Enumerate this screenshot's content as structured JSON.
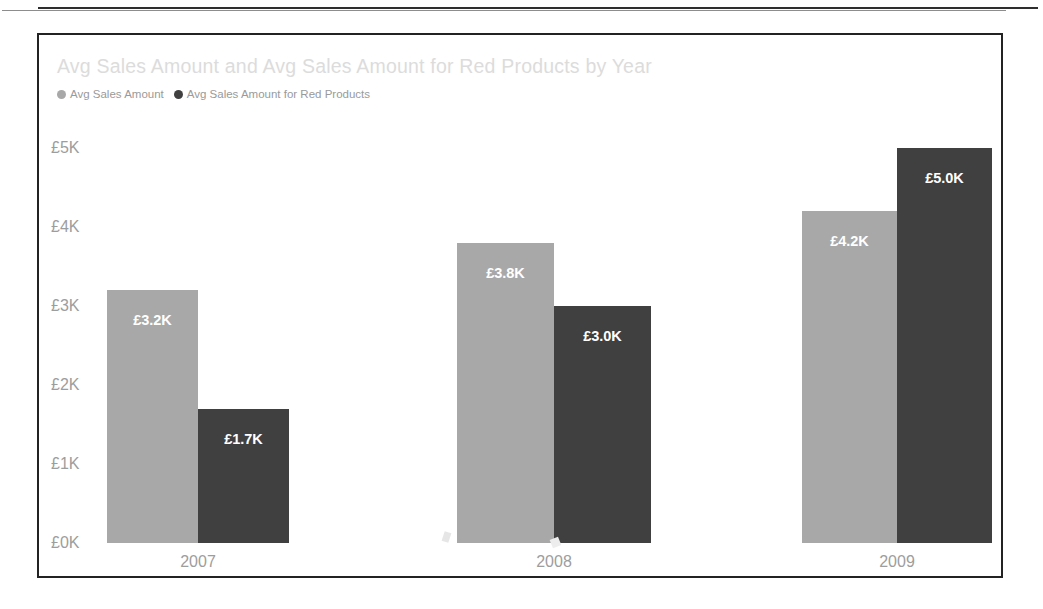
{
  "chart_data": {
    "type": "bar",
    "title": "Avg Sales Amount and Avg Sales Amount for Red Products by Year",
    "xlabel": "",
    "ylabel": "",
    "categories": [
      "2007",
      "2008",
      "2009"
    ],
    "series": [
      {
        "name": "Avg Sales Amount",
        "color": "#a8a8a8",
        "values": [
          3200,
          3800,
          4200
        ],
        "value_labels": [
          "£3.2K",
          "£3.8K",
          "£4.2K"
        ]
      },
      {
        "name": "Avg Sales Amount for Red Products",
        "color": "#404040",
        "values": [
          1700,
          3000,
          5000
        ],
        "value_labels": [
          "£1.7K",
          "£3.0K",
          "£5.0K"
        ]
      }
    ],
    "ylim": [
      0,
      5000
    ],
    "y_ticks": [
      0,
      1000,
      2000,
      3000,
      4000,
      5000
    ],
    "y_tick_labels": [
      "£0K",
      "£1K",
      "£2K",
      "£3K",
      "£4K",
      "£5K"
    ],
    "grid": false,
    "legend_position": "top-left",
    "currency": "GBP"
  },
  "legend": {
    "items": [
      {
        "label": "Avg Sales Amount",
        "color": "#a8a8a8"
      },
      {
        "label": "Avg Sales Amount for Red Products",
        "color": "#404040"
      }
    ]
  },
  "axis": {
    "y_tick_labels": [
      "£5K",
      "£4K",
      "£3K",
      "£2K",
      "£1K",
      "£0K"
    ],
    "x_tick_labels": [
      "2007",
      "2008",
      "2009"
    ]
  },
  "bars": [
    {
      "category": "2007",
      "series": "Avg Sales Amount",
      "label": "£3.2K"
    },
    {
      "category": "2007",
      "series": "Avg Sales Amount for Red Products",
      "label": "£1.7K"
    },
    {
      "category": "2008",
      "series": "Avg Sales Amount",
      "label": "£3.8K"
    },
    {
      "category": "2008",
      "series": "Avg Sales Amount for Red Products",
      "label": "£3.0K"
    },
    {
      "category": "2009",
      "series": "Avg Sales Amount",
      "label": "£4.2K"
    },
    {
      "category": "2009",
      "series": "Avg Sales Amount for Red Products",
      "label": "£5.0K"
    }
  ],
  "colors": {
    "series_light": "#a8a8a8",
    "series_dark": "#404040",
    "title": "#dcdcdc",
    "axis_text": "#9d9d9d",
    "frame": "#232323"
  }
}
